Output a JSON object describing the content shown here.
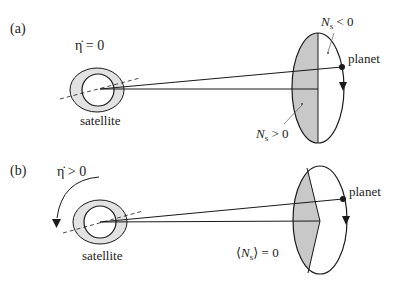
{
  "panels": [
    {
      "id": "a",
      "label": "(a)",
      "eta_label": "η̇ = 0",
      "satellite_label": "satellite",
      "planet_label": "planet",
      "region_labels": {
        "negative": "N",
        "negative_sub": "s",
        "negative_rel": " < 0",
        "positive": "N",
        "positive_sub": "s",
        "positive_rel": " > 0"
      }
    },
    {
      "id": "b",
      "label": "(b)",
      "eta_label": "η̇ > 0",
      "satellite_label": "satellite",
      "planet_label": "planet",
      "average_label": {
        "open": "⟨",
        "N": "N",
        "sub": "s",
        "close": "⟩ = 0"
      }
    }
  ],
  "colors": {
    "stroke": "#1a1a1a",
    "shade": "#c8c8c8",
    "satellite_ring": "#e2e2e2",
    "background": "#ffffff"
  }
}
